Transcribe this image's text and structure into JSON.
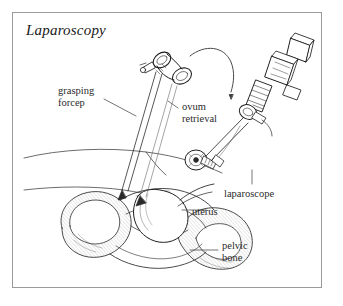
{
  "figure": {
    "title": "Laparoscopy",
    "border_color": "#9a9a9a",
    "background_color": "#ffffff",
    "ink_color": "#1a1a1a"
  },
  "labels": {
    "grasping_forcep": "grasping\nforcep",
    "grasping_forcep_line1": "grasping",
    "grasping_forcep_line2": "forcep",
    "ovum_retrieval_line1": "ovum",
    "ovum_retrieval_line2": "retrieval",
    "laparoscope": "laparoscope",
    "uterus": "uterus",
    "pelvic_bone_line1": "pelvic",
    "pelvic_bone_line2": "bone"
  },
  "diagram": {
    "type": "medical-line-illustration",
    "parts": [
      {
        "name": "grasping-forcep",
        "description": "ring-handled scissor-grip instrument with long thin shaft entering abdomen, upper left instrument"
      },
      {
        "name": "laparoscope",
        "description": "camera instrument with angular head, ribbed barrel and long shaft entering from upper right"
      },
      {
        "name": "ovum-retrieval-site",
        "description": "ovary with aspirating needle tip at center of pelvis"
      },
      {
        "name": "uterus",
        "description": "central pear-shaped organ in pelvic cavity"
      },
      {
        "name": "pelvic-bone",
        "description": "hatched and stippled pelvic bone forming lower portion of figure"
      },
      {
        "name": "abdominal-wall",
        "description": "two sweeping curves across the left of the figure"
      },
      {
        "name": "rotation-arrow",
        "description": "curved arrow near top center indicating instrument rotation"
      }
    ]
  }
}
